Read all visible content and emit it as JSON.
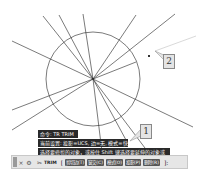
{
  "drawing": {
    "circle": {
      "cx": 93,
      "cy": 79,
      "r": 47
    },
    "center": {
      "x": 93,
      "y": 79
    },
    "lines": [
      {
        "x1": 12,
        "y1": 41,
        "x2": 93,
        "y2": 79
      },
      {
        "x1": 43,
        "y1": 16,
        "x2": 93,
        "y2": 79
      },
      {
        "x1": 59,
        "y1": 15,
        "x2": 93,
        "y2": 79
      },
      {
        "x1": 83,
        "y1": 14,
        "x2": 93,
        "y2": 79
      },
      {
        "x1": 136,
        "y1": 15,
        "x2": 93,
        "y2": 79
      },
      {
        "x1": 175,
        "y1": 14,
        "x2": 93,
        "y2": 79
      },
      {
        "x1": 136,
        "y1": 62,
        "x2": 93,
        "y2": 79
      },
      {
        "x1": 12,
        "y1": 110,
        "x2": 93,
        "y2": 79
      },
      {
        "x1": 12,
        "y1": 130,
        "x2": 93,
        "y2": 79
      },
      {
        "x1": 102,
        "y1": 152,
        "x2": 93,
        "y2": 79
      },
      {
        "x1": 126,
        "y1": 140,
        "x2": 93,
        "y2": 79
      },
      {
        "x1": 148,
        "y1": 152,
        "x2": 93,
        "y2": 79
      },
      {
        "x1": 193,
        "y1": 127,
        "x2": 93,
        "y2": 79
      }
    ],
    "preview_line": {
      "x1": 155,
      "y1": 51,
      "x2": 196,
      "y2": 36,
      "color": "#cfcfcf"
    },
    "cursor": {
      "x": 148,
      "y": 55
    }
  },
  "callouts": [
    {
      "label": "1"
    },
    {
      "label": "2"
    }
  ],
  "command_history": [
    "命令: TR TRIM",
    "当前设置: 投影=UCS, 边=无, 模式=快速",
    "选择要修剪的对象，或按住 Shift 键选择要延伸的对象或"
  ],
  "command_line": {
    "close_icon": "×",
    "settings_icon": "⚙",
    "command_icon": "✂",
    "command_name": "TRIM",
    "open_bracket": "[",
    "options": [
      "剪切边(T)",
      "窗交(C)",
      "模式(O)",
      "投影(P)",
      "删除(R)"
    ],
    "suffix": "]:"
  }
}
